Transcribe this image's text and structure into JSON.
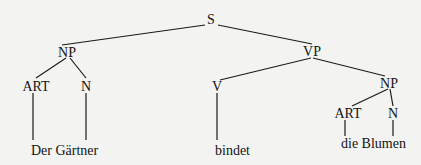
{
  "diagram": {
    "type": "syntax-tree",
    "nodes": {
      "s": {
        "label": "S"
      },
      "np_subject": {
        "label": "NP"
      },
      "art_subject": {
        "label": "ART"
      },
      "n_subject": {
        "label": "N"
      },
      "vp": {
        "label": "VP"
      },
      "v": {
        "label": "V"
      },
      "np_object": {
        "label": "NP"
      },
      "art_object": {
        "label": "ART"
      },
      "n_object": {
        "label": "N"
      }
    },
    "leaves": {
      "subject_phrase": "Der Gärtner",
      "verb": "bindet",
      "object_phrase": "die Blumen"
    },
    "edges": [
      [
        "S",
        "NP"
      ],
      [
        "S",
        "VP"
      ],
      [
        "NP",
        "ART"
      ],
      [
        "NP",
        "N"
      ],
      [
        "ART",
        "Der"
      ],
      [
        "N",
        "Gärtner"
      ],
      [
        "VP",
        "V"
      ],
      [
        "VP",
        "NP"
      ],
      [
        "V",
        "bindet"
      ],
      [
        "NP",
        "ART"
      ],
      [
        "NP",
        "N"
      ],
      [
        "ART",
        "die"
      ],
      [
        "N",
        "Blumen"
      ]
    ]
  }
}
